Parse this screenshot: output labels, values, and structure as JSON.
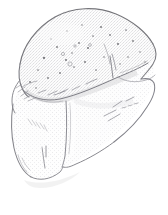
{
  "document": {
    "kind": "line-art-illustration",
    "subject_label": "loaf of bread",
    "medium_label": "pencil sketch with halftone shading",
    "view_label": "three-quarter perspective",
    "background_color": "#ffffff",
    "canvas_width": 168,
    "canvas_height": 215,
    "alt_text": "Hand-drawn grayscale sketch of a rectangular loaf of bread seen from a three-quarter angle, with a rounded domed top crust, speckled texture, and shaded front and side faces."
  },
  "palette": {
    "outline_dark": "#6e6e72",
    "outline_mid": "#8d8d92",
    "outline_light": "#b4b4b8",
    "crumb_speckle": "#7c7c80",
    "fill_top_crust": "#eeeeee",
    "fill_front_face": "#f3f3f3",
    "fill_side_face": "#f7f7f7",
    "shade_soft": "#e2e2e3",
    "shade_deep": "#d3d3d5",
    "highlight": "#fbfbfb",
    "paper_white": "#ffffff"
  },
  "regions": [
    {
      "id": "top-crust",
      "label": "Domed top crust",
      "fill": "#ededee",
      "notes": "Largest upper surface, speckled with small dark crumb dots"
    },
    {
      "id": "front-face",
      "label": "Front face of loaf",
      "fill": "#f4f4f5",
      "notes": "Lower-left panel below the crust fold line"
    },
    {
      "id": "side-face",
      "label": "Right end face of loaf",
      "fill": "#f6f6f7",
      "notes": "Right-hand panel receding into perspective"
    },
    {
      "id": "crust-lip",
      "label": "Crust overhang lip",
      "fill": "#f0f0f1",
      "notes": "Narrow band where the baked crust flares over the tin line"
    }
  ],
  "edges": [
    {
      "id": "outer-contour",
      "label": "Outer loaf contour"
    },
    {
      "id": "crust-fold-line",
      "label": "Crust fold line across the loaf"
    },
    {
      "id": "front-corner-crease",
      "label": "Vertical front corner crease"
    },
    {
      "id": "right-corner-crease",
      "label": "Right corner crease"
    },
    {
      "id": "base-line",
      "label": "Bottom base line of loaf"
    }
  ],
  "texture": {
    "speckle_count": 28,
    "hatch_group_count": 9,
    "halftone_pattern": "fine light dither",
    "speckle_color": "#7c7c80"
  }
}
